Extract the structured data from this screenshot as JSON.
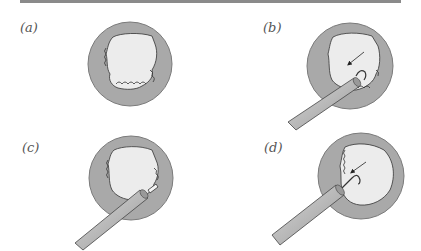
{
  "figure": {
    "panels": [
      {
        "id": "a",
        "label": "(a)",
        "description": "Cross-section with irregular fragmented inner lining, no instrument"
      },
      {
        "id": "b",
        "label": "(b)",
        "description": "Instrument with hooked tip inserted, arrow pointing to tip engaging fragments"
      },
      {
        "id": "c",
        "label": "(c)",
        "description": "Instrument with straight extended tip, fragments partly cleared"
      },
      {
        "id": "d",
        "label": "(d)",
        "description": "Instrument with hooked tip, arrow pointing to tip, lumen largely cleared"
      }
    ]
  },
  "colors": {
    "ring": "#a9a9a9",
    "ring_stroke": "#7a7a7a",
    "lumen": "#ececec",
    "instrument": "#b8b8b8",
    "ink": "#333333",
    "rule": "#8a8a8a"
  }
}
